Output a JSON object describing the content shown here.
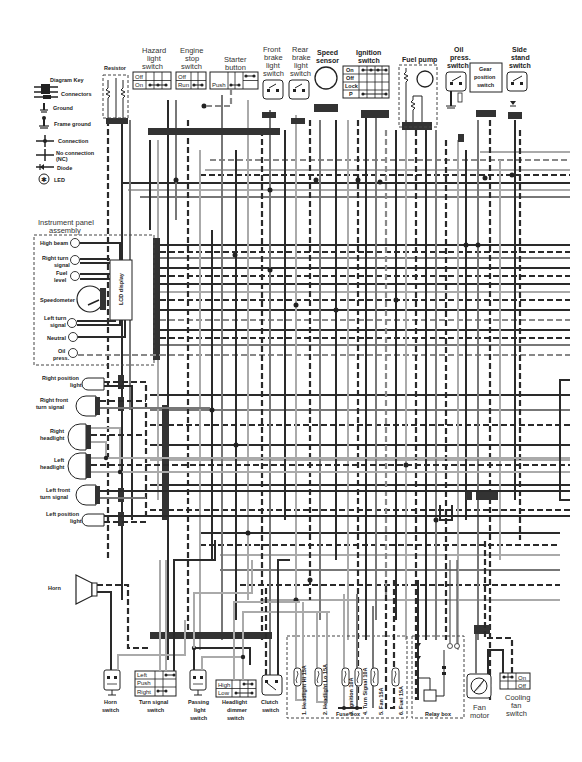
{
  "diagram": {
    "key": {
      "title": "Diagram Key",
      "items": [
        {
          "symbol": "connectors",
          "label": "Connectors"
        },
        {
          "symbol": "ground",
          "label": "Ground"
        },
        {
          "symbol": "frame-ground",
          "label": "Frame ground"
        },
        {
          "symbol": "connection",
          "label": "Connection"
        },
        {
          "symbol": "no-connection",
          "label": "No connection",
          "sublabel": "(NC)"
        },
        {
          "symbol": "diode",
          "label": "Diode"
        },
        {
          "symbol": "led",
          "label": "LED"
        }
      ]
    },
    "top_components": {
      "resistor": "Resistor",
      "hazard": {
        "label": [
          "Hazard",
          "light",
          "switch"
        ],
        "rows": [
          "Off",
          "On"
        ]
      },
      "engine_stop": {
        "label": [
          "Engine",
          "stop",
          "switch"
        ],
        "rows": [
          "Off",
          "Run"
        ]
      },
      "starter": {
        "label": [
          "Starter",
          "button"
        ],
        "rows": [
          "Push"
        ]
      },
      "front_brake": [
        "Front",
        "brake",
        "light",
        "switch"
      ],
      "rear_brake": [
        "Rear",
        "brake",
        "light",
        "switch"
      ],
      "speed_sensor": [
        "Speed",
        "sensor"
      ],
      "ignition": {
        "label": [
          "Ignition",
          "switch"
        ],
        "rows": [
          "On",
          "Off",
          "Lock",
          "P"
        ]
      },
      "fuel_pump": "Fuel pump",
      "oil_press": [
        "Oil",
        "press.",
        "switch"
      ],
      "gear_position": [
        "Gear",
        "position",
        "switch"
      ],
      "side_stand": [
        "Side",
        "stand",
        "switch"
      ]
    },
    "instrument_panel": {
      "title": [
        "Instrument panel",
        "assembly"
      ],
      "lcd": "LCD display",
      "items": [
        {
          "label": [
            "High beam"
          ]
        },
        {
          "label": [
            "Right turn",
            "signal"
          ]
        },
        {
          "label": [
            "Fuel",
            "level"
          ]
        },
        {
          "label": [
            "Speedometer"
          ]
        },
        {
          "label": [
            "Left turn",
            "signal"
          ]
        },
        {
          "label": [
            "Neutral"
          ]
        },
        {
          "label": [
            "Oil",
            "press."
          ]
        }
      ]
    },
    "lights": [
      {
        "label": [
          "Right position",
          "light"
        ]
      },
      {
        "label": [
          "Right front",
          "turn signal"
        ]
      },
      {
        "label": [
          "Right",
          "headlight"
        ]
      },
      {
        "label": [
          "Left",
          "headlight"
        ]
      },
      {
        "label": [
          "Left front",
          "turn signal"
        ]
      },
      {
        "label": [
          "Left position",
          "light"
        ]
      }
    ],
    "horn": "Horn",
    "bottom_components": {
      "horn_switch": [
        "Horn",
        "switch"
      ],
      "turn_signal": {
        "label": [
          "Turn signal",
          "switch"
        ],
        "rows": [
          "Left",
          "Push",
          "Right"
        ]
      },
      "passing": [
        "Passing",
        "light",
        "switch"
      ],
      "dimmer": {
        "label": [
          "Headlight",
          "dimmer",
          "switch"
        ],
        "rows": [
          "High",
          "Low"
        ]
      },
      "clutch": [
        "Clutch",
        "switch"
      ],
      "fan_motor": [
        "Fan",
        "motor"
      ],
      "cooling_fan": {
        "label": [
          "Cooling",
          "fan",
          "switch"
        ],
        "rows": [
          "On",
          "Off"
        ]
      }
    },
    "fuse_box": {
      "title": "Fuse box",
      "fuses": [
        "1. Headlight Hi 15A",
        "2. Headlight Lo 15A",
        "3. Ignition 10A",
        "4. Turn Signal 10A",
        "5. Fan 15A",
        "6. Fuel 15A"
      ]
    },
    "relay_box": {
      "title": "Relay box"
    },
    "colors": {
      "dark_wire": "#2a2a2a",
      "mid_wire": "#777777",
      "light_wire": "#aaaaaa",
      "bus": "#333333"
    }
  }
}
